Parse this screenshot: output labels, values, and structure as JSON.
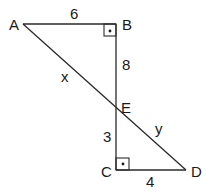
{
  "diagram": {
    "type": "geometry",
    "points": {
      "A": {
        "label": "A",
        "x": 23,
        "y": 24
      },
      "B": {
        "label": "B",
        "x": 116,
        "y": 24
      },
      "E": {
        "label": "E",
        "x": 116,
        "y": 109
      },
      "C": {
        "label": "C",
        "x": 116,
        "y": 170
      },
      "D": {
        "label": "D",
        "x": 186,
        "y": 170
      }
    },
    "segments": {
      "AB": {
        "label": "6"
      },
      "BE": {
        "label": "8"
      },
      "AE": {
        "label": "x"
      },
      "EC": {
        "label": "3"
      },
      "CD": {
        "label": "4"
      },
      "ED": {
        "label": "y"
      }
    },
    "right_angles": [
      "B",
      "C"
    ]
  }
}
